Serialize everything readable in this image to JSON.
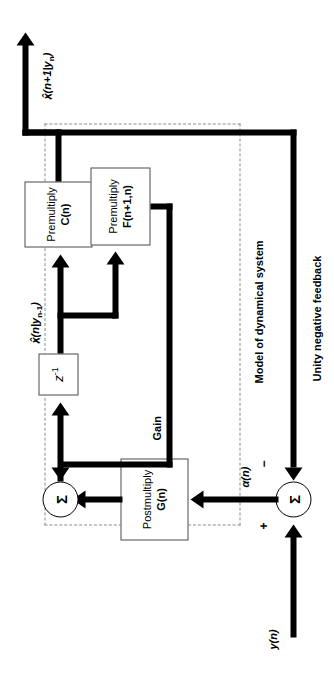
{
  "diagram": {
    "type": "signal-flow block diagram",
    "orientation": "rotated-90-ccw"
  },
  "groups": {
    "model_label": "Model of dynamical system",
    "feedback_label": "Unity negative feedback",
    "gain_label": "Gain"
  },
  "blocks": {
    "premultiply_c": {
      "line1": "Premultiply",
      "line2": "C(n)"
    },
    "premultiply_f": {
      "line1": "Premultiply",
      "line2": "F(n+1,n)"
    },
    "postmultiply_g": {
      "line1": "Postmultiply",
      "line2": "G(n)"
    },
    "unit_delay": {
      "label": "z",
      "exponent": "-1",
      "full": "z-1"
    }
  },
  "nodes": {
    "summer_input": {
      "symbol": "Σ",
      "plus": "+",
      "minus": "−"
    },
    "summer_state": {
      "symbol": "Σ"
    }
  },
  "signals": {
    "input": "y(n)",
    "innovation": "α(n)",
    "state_estimate_delayed": "x̂(n|y",
    "state_estimate_delayed_sub": "n-1",
    "state_estimate_delayed_close": ")",
    "output": "x̂(n+1|y",
    "output_sub": "n",
    "output_close": ")",
    "hat": "˄"
  },
  "colors": {
    "line": "#000000",
    "block_border": "#4a4a4a",
    "dashed_border": "#8a8a8a",
    "background": "#ffffff"
  }
}
